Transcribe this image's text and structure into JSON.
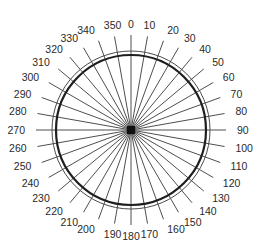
{
  "diagram": {
    "type": "polar-angle-scale",
    "angle_unit": "degrees",
    "step": 10,
    "labels": [
      "0",
      "10",
      "20",
      "30",
      "40",
      "50",
      "60",
      "70",
      "80",
      "90",
      "100",
      "110",
      "120",
      "130",
      "140",
      "150",
      "160",
      "170",
      "180",
      "190",
      "200",
      "210",
      "220",
      "230",
      "240",
      "250",
      "260",
      "270",
      "280",
      "290",
      "300",
      "310",
      "320",
      "330",
      "340",
      "350"
    ],
    "colors": {
      "spoke": "#3a3a3a",
      "ring": "#1e1e1e",
      "label": "#2a2a2a",
      "background": "#ffffff"
    }
  }
}
